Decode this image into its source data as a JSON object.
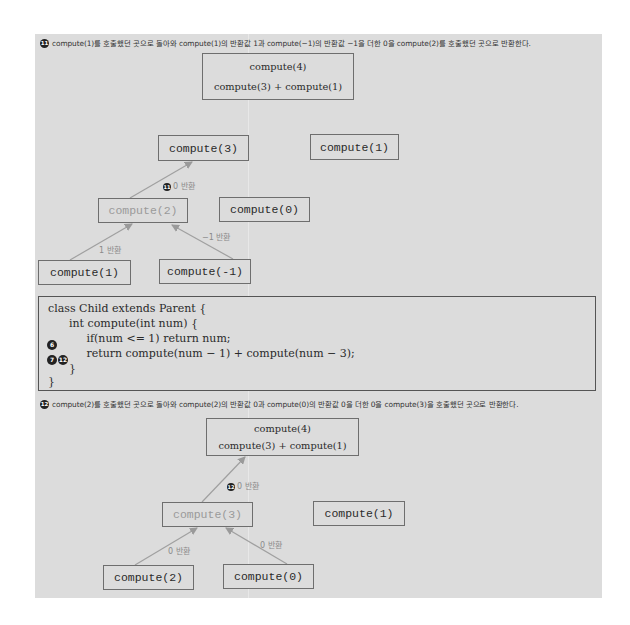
{
  "step11": {
    "badge": "11",
    "caption_parts": [
      "compute(1)를 호출했던 곳으로 돌아와 compute(1)의 반환값 1과 compute(−1)의 반환값  −1을 더한 0을 compute(2)를 호출했던 곳으로 반환한다."
    ],
    "root_box": {
      "line1": "compute(4)",
      "line2": "compute(3) + compute(1)"
    },
    "nodes": {
      "compute3": "compute(3)",
      "compute1_right": "compute(1)",
      "compute2": "compute(2)",
      "compute0": "compute(0)",
      "compute1_left": "compute(1)",
      "computeNeg1": "compute(-1)"
    },
    "edge_labels": {
      "to_compute3_badge": "11",
      "to_compute3": "0 반환",
      "from_compute1": "1 반환",
      "from_computeNeg1": "−1 반환"
    }
  },
  "code": {
    "lines": [
      "class Child extends Parent {",
      "      int compute(int num) {",
      "           if(num <= 1) return num;",
      "           return compute(num − 1) + compute(num − 3);",
      "      }",
      "}"
    ],
    "markers": {
      "line3": [
        "6"
      ],
      "line4": [
        "7",
        "12"
      ]
    }
  },
  "step12": {
    "badge": "12",
    "caption": "compute(2)를 호출했던 곳으로 돌아와 compute(2)의 반환값 0과 compute(0)의 반환값 0을 더한 0을 compute(3)을 호출했던 곳으로 반환한다.",
    "root_box": {
      "line1": "compute(4)",
      "line2": "compute(3) + compute(1)"
    },
    "nodes": {
      "compute3": "compute(3)",
      "compute1_right": "compute(1)",
      "compute2": "compute(2)",
      "compute0": "compute(0)"
    },
    "edge_labels": {
      "to_root_badge": "12",
      "to_root": "0 반환",
      "from_compute2": "0 반환",
      "from_compute0": "0 반환"
    }
  },
  "colors": {
    "panel_bg": "#dcdcdc",
    "box_border": "#6e6e6e",
    "arrow": "#9a9a9a",
    "faded_text": "#9a9a9a"
  }
}
